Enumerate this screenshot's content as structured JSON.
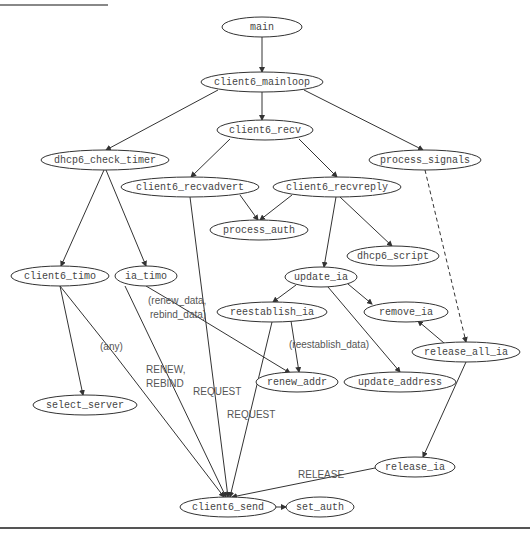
{
  "diagram": {
    "type": "call-graph",
    "nodes": [
      {
        "id": "main",
        "label": "main",
        "cx": 262,
        "cy": 27,
        "rx": 40,
        "ry": 10
      },
      {
        "id": "client6_mainloop",
        "label": "client6_mainloop",
        "cx": 262,
        "cy": 82,
        "rx": 61,
        "ry": 10
      },
      {
        "id": "client6_recv",
        "label": "client6_recv",
        "cx": 265,
        "cy": 130,
        "rx": 48,
        "ry": 10
      },
      {
        "id": "dhcp6_check_timer",
        "label": "dhcp6_check_timer",
        "cx": 105,
        "cy": 160,
        "rx": 64,
        "ry": 10
      },
      {
        "id": "process_signals",
        "label": "process_signals",
        "cx": 425,
        "cy": 160,
        "rx": 56,
        "ry": 10
      },
      {
        "id": "client6_recvadvert",
        "label": "client6_recvadvert",
        "cx": 190,
        "cy": 187,
        "rx": 69,
        "ry": 10
      },
      {
        "id": "client6_recvreply",
        "label": "client6_recvreply",
        "cx": 337,
        "cy": 187,
        "rx": 64,
        "ry": 10
      },
      {
        "id": "process_auth",
        "label": "process_auth",
        "cx": 259,
        "cy": 230,
        "rx": 49,
        "ry": 10
      },
      {
        "id": "dhcp6_script",
        "label": "dhcp6_script",
        "cx": 393,
        "cy": 256,
        "rx": 46,
        "ry": 10
      },
      {
        "id": "client6_timo",
        "label": "client6_timo",
        "cx": 60,
        "cy": 276,
        "rx": 49,
        "ry": 10
      },
      {
        "id": "ia_timo",
        "label": "ia_timo",
        "cx": 146,
        "cy": 276,
        "rx": 31,
        "ry": 10
      },
      {
        "id": "update_ia",
        "label": "update_ia",
        "cx": 321,
        "cy": 277,
        "rx": 36,
        "ry": 10
      },
      {
        "id": "reestablish_ia",
        "label": "reestablish_ia",
        "cx": 272,
        "cy": 312,
        "rx": 55,
        "ry": 10
      },
      {
        "id": "remove_ia",
        "label": "remove_ia",
        "cx": 406,
        "cy": 312,
        "rx": 42,
        "ry": 10
      },
      {
        "id": "release_all_ia",
        "label": "release_all_ia",
        "cx": 466,
        "cy": 352,
        "rx": 54,
        "ry": 10
      },
      {
        "id": "renew_addr",
        "label": "renew_addr",
        "cx": 297,
        "cy": 382,
        "rx": 41,
        "ry": 10
      },
      {
        "id": "update_address",
        "label": "update_address",
        "cx": 400,
        "cy": 382,
        "rx": 56,
        "ry": 10
      },
      {
        "id": "select_server",
        "label": "select_server",
        "cx": 85,
        "cy": 405,
        "rx": 52,
        "ry": 10
      },
      {
        "id": "release_ia",
        "label": "release_ia",
        "cx": 415,
        "cy": 467,
        "rx": 40,
        "ry": 10
      },
      {
        "id": "client6_send",
        "label": "client6_send",
        "cx": 228,
        "cy": 507,
        "rx": 48,
        "ry": 10
      },
      {
        "id": "set_auth",
        "label": "set_auth",
        "cx": 320,
        "cy": 507,
        "rx": 34,
        "ry": 10
      }
    ],
    "edges": [
      {
        "from": "main",
        "to": "client6_mainloop",
        "points": [
          [
            262,
            37
          ],
          [
            262,
            72
          ]
        ]
      },
      {
        "from": "client6_mainloop",
        "to": "dhcp6_check_timer",
        "points": [
          [
            218,
            90
          ],
          [
            106,
            150
          ]
        ]
      },
      {
        "from": "client6_mainloop",
        "to": "client6_recv",
        "points": [
          [
            262,
            92
          ],
          [
            262,
            120
          ]
        ]
      },
      {
        "from": "client6_mainloop",
        "to": "process_signals",
        "points": [
          [
            304,
            90
          ],
          [
            423,
            150
          ]
        ]
      },
      {
        "from": "client6_recv",
        "to": "client6_recvadvert",
        "points": [
          [
            230,
            139
          ],
          [
            191,
            177
          ]
        ]
      },
      {
        "from": "client6_recv",
        "to": "client6_recvreply",
        "points": [
          [
            299,
            139
          ],
          [
            337,
            177
          ]
        ]
      },
      {
        "from": "client6_recvadvert",
        "to": "process_auth",
        "points": [
          [
            240,
            195
          ],
          [
            258,
            220
          ]
        ]
      },
      {
        "from": "client6_recvreply",
        "to": "process_auth",
        "points": [
          [
            292,
            195
          ],
          [
            260,
            220
          ]
        ]
      },
      {
        "from": "client6_recvreply",
        "to": "update_ia",
        "points": [
          [
            336,
            197
          ],
          [
            324,
            267
          ]
        ]
      },
      {
        "from": "client6_recvreply",
        "to": "dhcp6_script",
        "points": [
          [
            340,
            197
          ],
          [
            392,
            246
          ]
        ]
      },
      {
        "from": "dhcp6_check_timer",
        "to": "client6_timo",
        "points": [
          [
            104,
            170
          ],
          [
            61,
            266
          ]
        ]
      },
      {
        "from": "dhcp6_check_timer",
        "to": "ia_timo",
        "points": [
          [
            106,
            170
          ],
          [
            146,
            266
          ]
        ]
      },
      {
        "from": "update_ia",
        "to": "reestablish_ia",
        "points": [
          [
            296,
            285
          ],
          [
            273,
            302
          ]
        ]
      },
      {
        "from": "update_ia",
        "to": "remove_ia",
        "points": [
          [
            348,
            284
          ],
          [
            372,
            304
          ]
        ]
      },
      {
        "from": "update_ia",
        "to": "update_address",
        "points": [
          [
            328,
            287
          ],
          [
            400,
            372
          ]
        ]
      },
      {
        "from": "process_signals",
        "to": "release_all_ia",
        "points": [
          [
            425,
            170
          ],
          [
            466,
            342
          ]
        ],
        "style": "dashed"
      },
      {
        "from": "release_all_ia",
        "to": "remove_ia",
        "points": [
          [
            444,
            343
          ],
          [
            418,
            321
          ]
        ]
      },
      {
        "from": "release_all_ia",
        "to": "release_ia",
        "points": [
          [
            466,
            362
          ],
          [
            423,
            457
          ]
        ]
      },
      {
        "from": "reestablish_ia",
        "to": "renew_addr",
        "points": [
          [
            291,
            321
          ],
          [
            299,
            372
          ]
        ],
        "label": "(reestablish_data)"
      },
      {
        "from": "ia_timo",
        "to": "renew_addr",
        "points": [
          [
            146,
            286
          ],
          [
            168,
            299
          ],
          [
            290,
            373
          ]
        ],
        "label": "(renew_data, rebind_data)"
      },
      {
        "from": "client6_timo",
        "to": "select_server",
        "points": [
          [
            60,
            286
          ],
          [
            83,
            395
          ]
        ]
      },
      {
        "from": "client6_timo",
        "to": "client6_send",
        "points": [
          [
            60,
            286
          ],
          [
            115,
            355
          ],
          [
            224,
            497
          ]
        ],
        "label": "(any)"
      },
      {
        "from": "ia_timo",
        "to": "client6_send",
        "points": [
          [
            125,
            286
          ],
          [
            226,
            497
          ]
        ],
        "label": "RENEW, REBIND"
      },
      {
        "from": "client6_recvadvert",
        "to": "client6_send",
        "points": [
          [
            190,
            197
          ],
          [
            228,
            497
          ]
        ],
        "label": "REQUEST"
      },
      {
        "from": "reestablish_ia",
        "to": "client6_send",
        "points": [
          [
            272,
            322
          ],
          [
            230,
            497
          ]
        ],
        "label": "REQUEST"
      },
      {
        "from": "release_ia",
        "to": "client6_send",
        "points": [
          [
            375,
            468
          ],
          [
            232,
            497
          ]
        ],
        "label": "RELEASE"
      },
      {
        "from": "client6_send",
        "to": "set_auth",
        "points": [
          [
            276,
            507
          ],
          [
            286,
            507
          ]
        ]
      }
    ],
    "edge_labels": [
      {
        "text": "(renew_data,",
        "x": 148,
        "y": 304
      },
      {
        "text": "rebind_data)",
        "x": 150,
        "y": 318
      },
      {
        "text": "(reestablish_data)",
        "x": 289,
        "y": 348
      },
      {
        "text": "(any)",
        "x": 100,
        "y": 350
      },
      {
        "text": "RENEW,",
        "x": 146,
        "y": 373
      },
      {
        "text": "REBIND",
        "x": 146,
        "y": 387
      },
      {
        "text": "REQUEST",
        "x": 193,
        "y": 395
      },
      {
        "text": "REQUEST",
        "x": 227,
        "y": 418
      },
      {
        "text": "RELEASE",
        "x": 298,
        "y": 478
      }
    ]
  }
}
